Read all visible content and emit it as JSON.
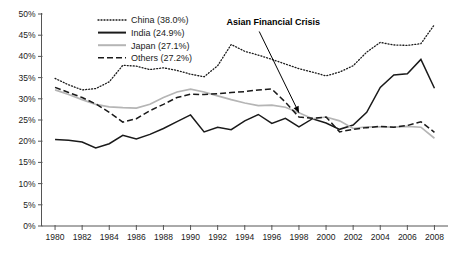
{
  "chart_data": {
    "type": "line",
    "title": "",
    "xlabel": "",
    "ylabel": "",
    "xlim": [
      1979,
      2009
    ],
    "ylim": [
      0,
      50
    ],
    "grid": false,
    "legend_position": "top-center",
    "y_ticks": [
      "0%",
      "5%",
      "10%",
      "15%",
      "20%",
      "25%",
      "30%",
      "35%",
      "40%",
      "45%",
      "50%"
    ],
    "y_tick_values": [
      0,
      5,
      10,
      15,
      20,
      25,
      30,
      35,
      40,
      45,
      50
    ],
    "x_ticks": [
      "1980",
      "1982",
      "1984",
      "1986",
      "1988",
      "1990",
      "1992",
      "1994",
      "1996",
      "1998",
      "2000",
      "2002",
      "2004",
      "2006",
      "2008"
    ],
    "x_tick_values": [
      1980,
      1982,
      1984,
      1986,
      1988,
      1990,
      1992,
      1994,
      1996,
      1998,
      2000,
      2002,
      2004,
      2006,
      2008
    ],
    "x": [
      1980,
      1981,
      1982,
      1983,
      1984,
      1985,
      1986,
      1987,
      1988,
      1989,
      1990,
      1991,
      1992,
      1993,
      1994,
      1995,
      1996,
      1997,
      1998,
      1999,
      2000,
      2001,
      2002,
      2003,
      2004,
      2005,
      2006,
      2007,
      2008
    ],
    "series": [
      {
        "name": "China (38.0%)",
        "short_name": "China",
        "average": "38.0%",
        "style": "dotted",
        "color": "#1a1a1a",
        "values": [
          34.8,
          33.3,
          32.1,
          32.4,
          34.0,
          37.9,
          37.7,
          36.9,
          37.3,
          36.7,
          35.8,
          35.2,
          37.8,
          42.8,
          41.2,
          40.3,
          39.3,
          38.2,
          37.1,
          36.3,
          35.4,
          36.3,
          37.8,
          41.0,
          43.3,
          42.7,
          42.6,
          43.0,
          47.5
        ]
      },
      {
        "name": "India (24.9%)",
        "short_name": "India",
        "average": "24.9%",
        "style": "solid-thick",
        "color": "#1a1a1a",
        "values": [
          20.4,
          20.2,
          19.8,
          18.4,
          19.4,
          21.4,
          20.5,
          21.6,
          23.0,
          24.6,
          26.2,
          22.2,
          23.3,
          22.7,
          24.8,
          26.3,
          24.2,
          25.4,
          23.4,
          25.3,
          24.3,
          22.8,
          23.8,
          26.8,
          32.7,
          35.6,
          35.9,
          39.3,
          32.5
        ]
      },
      {
        "name": "Japan (27.1%)",
        "short_name": "Japan",
        "average": "27.1%",
        "style": "solid-gray",
        "color": "#b5b5b5",
        "values": [
          32.1,
          31.0,
          29.8,
          28.7,
          28.1,
          27.9,
          27.8,
          28.7,
          30.3,
          31.6,
          32.3,
          31.6,
          30.7,
          29.8,
          29.0,
          28.4,
          28.5,
          28.0,
          26.7,
          25.3,
          25.7,
          24.8,
          23.0,
          23.4,
          23.4,
          23.3,
          23.5,
          23.3,
          20.7
        ]
      },
      {
        "name": "Others (27.2%)",
        "short_name": "Others",
        "average": "27.2%",
        "style": "dashed",
        "color": "#1a1a1a",
        "values": [
          32.7,
          31.5,
          30.3,
          28.8,
          26.8,
          24.5,
          25.3,
          27.2,
          28.7,
          30.3,
          31.1,
          31.0,
          31.2,
          31.5,
          31.7,
          32.1,
          32.3,
          29.2,
          25.7,
          25.4,
          25.7,
          22.2,
          22.8,
          23.2,
          23.5,
          23.3,
          23.7,
          24.6,
          22.1
        ]
      }
    ],
    "annotations": [
      {
        "text": "Asian Financial Crisis",
        "target_x": 1998,
        "target_y": 26.0,
        "label_x": 1996.1,
        "label_y": 48.0
      }
    ]
  }
}
